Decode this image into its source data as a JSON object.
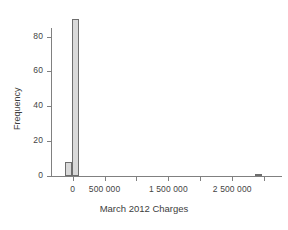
{
  "chart_data": {
    "type": "bar",
    "title": "",
    "subtitle": "",
    "xlabel": "March 2012 Charges",
    "ylabel": "Frequency",
    "xlim": [
      -260000,
      3280000
    ],
    "ylim": [
      0,
      93
    ],
    "grid": false,
    "legend": null,
    "xticks": [
      {
        "value": 0,
        "label": "0"
      },
      {
        "value": 500000,
        "label": "500 000"
      },
      {
        "value": 1000000,
        "label": ""
      },
      {
        "value": 1500000,
        "label": "1 500 000"
      },
      {
        "value": 2000000,
        "label": ""
      },
      {
        "value": 2500000,
        "label": "2 500 000"
      },
      {
        "value": 3000000,
        "label": ""
      }
    ],
    "yticks": [
      {
        "value": 0,
        "label": "0"
      },
      {
        "value": 20,
        "label": "20"
      },
      {
        "value": 40,
        "label": "40"
      },
      {
        "value": 60,
        "label": "60"
      },
      {
        "value": 80,
        "label": "80"
      }
    ],
    "categories": [
      "-100000",
      "0",
      "2900000"
    ],
    "values": [
      8,
      90,
      1
    ],
    "bars": [
      {
        "x_left": -120000,
        "x_right": -10000,
        "height": 8
      },
      {
        "x_left": -10000,
        "x_right": 100000,
        "height": 90
      },
      {
        "x_left": 2850000,
        "x_right": 2960000,
        "height": 1
      }
    ],
    "bar_fill_color": "#d9d9d9",
    "bar_edge_color": "#6e6e6e",
    "axis_color": "#808080",
    "text_color": "#3d3d3d",
    "background_color": "#ffffff"
  }
}
